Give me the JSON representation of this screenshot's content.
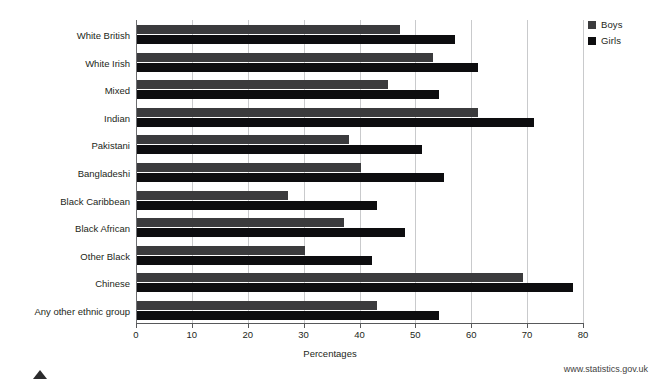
{
  "chart_data": {
    "type": "bar",
    "orientation": "horizontal",
    "title": "",
    "xlabel": "Percentages",
    "ylabel": "",
    "xlim": [
      0,
      80
    ],
    "xticks": [
      0,
      10,
      20,
      30,
      40,
      50,
      60,
      70,
      80
    ],
    "grid": "vertical",
    "legend_position": "top-right",
    "categories": [
      "White British",
      "White Irish",
      "Mixed",
      "Indian",
      "Pakistani",
      "Bangladeshi",
      "Black Caribbean",
      "Black African",
      "Other Black",
      "Chinese",
      "Any other ethnic group"
    ],
    "series": [
      {
        "name": "Boys",
        "color": "#3b3b3d",
        "values": [
          47,
          53,
          45,
          61,
          38,
          40,
          27,
          37,
          30,
          69,
          43
        ]
      },
      {
        "name": "Girls",
        "color": "#0d0d0f",
        "values": [
          57,
          61,
          54,
          71,
          51,
          55,
          43,
          48,
          42,
          78,
          54
        ]
      }
    ]
  },
  "footer": {
    "source": "www.statistics.gov.uk"
  }
}
